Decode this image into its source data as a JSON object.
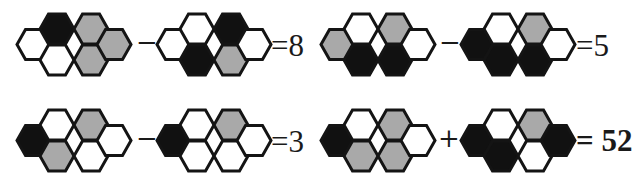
{
  "colors": {
    "white": "#ffffff",
    "gray": "#a9a9a9",
    "black": "#111111",
    "stroke": "#141414"
  },
  "hex_order": [
    "left",
    "top_center_left",
    "bottom_center_left",
    "top_center_right",
    "bottom_center_right",
    "right"
  ],
  "equations": [
    {
      "row": 1,
      "position": "left",
      "clusters": [
        [
          "white",
          "black",
          "white",
          "gray",
          "gray",
          "gray"
        ],
        [
          "white",
          "white",
          "black",
          "black",
          "gray",
          "white"
        ]
      ],
      "operator": "−",
      "result": "=8"
    },
    {
      "row": 1,
      "position": "right",
      "clusters": [
        [
          "gray",
          "white",
          "black",
          "gray",
          "black",
          "white"
        ],
        [
          "black",
          "white",
          "black",
          "gray",
          "black",
          "white"
        ]
      ],
      "operator": "−",
      "result": "=5"
    },
    {
      "row": 2,
      "position": "left",
      "clusters": [
        [
          "black",
          "white",
          "gray",
          "gray",
          "white",
          "white"
        ],
        [
          "black",
          "white",
          "white",
          "gray",
          "white",
          "white"
        ]
      ],
      "operator": "−",
      "result": "=3"
    },
    {
      "row": 2,
      "position": "right",
      "clusters": [
        [
          "black",
          "white",
          "gray",
          "gray",
          "gray",
          "white"
        ],
        [
          "black",
          "white",
          "black",
          "gray",
          "white",
          "black"
        ]
      ],
      "operator": "+",
      "result": "= 52"
    }
  ]
}
